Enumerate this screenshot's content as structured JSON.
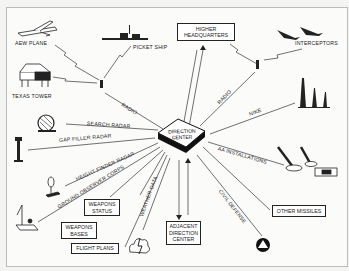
{
  "diagram": {
    "center": {
      "label_line1": "DIRECTION",
      "label_line2": "CENTER"
    },
    "boxes": {
      "higher_hq": {
        "line1": "HIGHER",
        "line2": "HEADQUARTERS"
      },
      "weapons_status": {
        "line1": "WEAPONS",
        "line2": "STATUS"
      },
      "weapons_bases": {
        "line1": "WEAPONS",
        "line2": "BASES"
      },
      "flight_plans": "FLIGHT PLANS",
      "adjacent_dc": {
        "line1": "ADJACENT",
        "line2": "DIRECTION",
        "line3": "CENTER"
      },
      "other_missiles": "OTHER MISSILES"
    },
    "nodes": {
      "aew_plane": "AEW PLANE",
      "picket_ship": "PICKET SHIP",
      "texas_tower": "TEXAS TOWER",
      "interceptors": "INTERCEPTORS"
    },
    "links": {
      "radio_left": "RADIO",
      "radio_right": "RADIO",
      "search_radar": "SEARCH RADAR",
      "gap_filler_radar": "GAP FILLER RADAR",
      "height_finder_radar": "HEIGHT FINDER RADAR",
      "ground_observer_corps": "GROUND OBSERVER CORPS",
      "weather_data": "WEATHER DATA",
      "nike": "NIKE",
      "aa_installations": "AA INSTALLATIONS",
      "civil_defense": "CIVIL DEFENSE"
    }
  }
}
